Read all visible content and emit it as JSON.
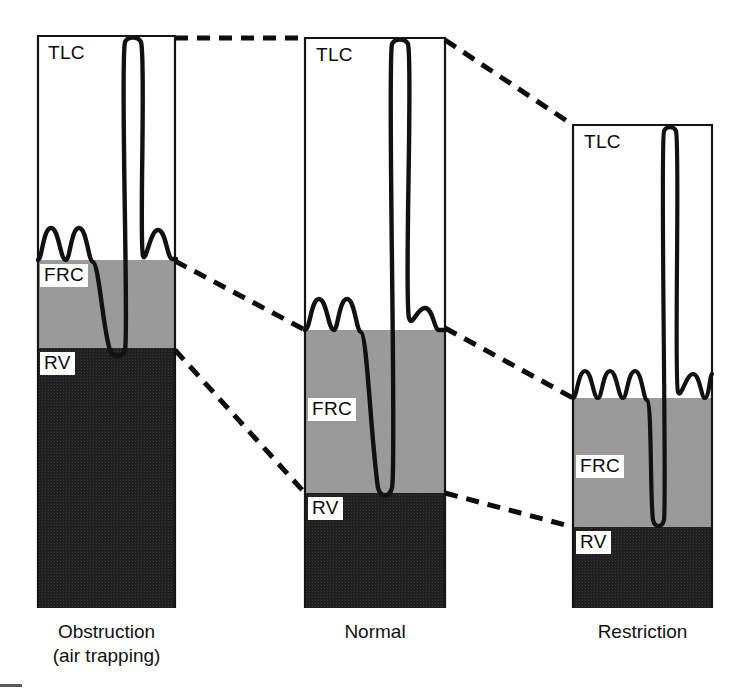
{
  "figure": {
    "type": "lung-volume-spirogram-comparison",
    "background_color": "#ffffff",
    "width": 737,
    "height": 690
  },
  "colors": {
    "tlc_fill": "#ffffff",
    "frc_fill": "#9a9a9a",
    "rv_fill": "#1e1e1e",
    "outline": "#141414",
    "trace": "#111111",
    "dashed_connector": "#0d0d0d",
    "label_text": "#0b0b0b",
    "label_background": "#ffffff"
  },
  "volume_labels": {
    "tlc": "TLC",
    "frc": "FRC",
    "rv": "RV"
  },
  "panels": [
    {
      "id": "obstruction",
      "caption": "Obstruction\n(air trapping)",
      "caption_line1": "Obstruction",
      "caption_line2": "(air trapping)",
      "box": {
        "x": 38,
        "y": 36,
        "width": 137,
        "height": 572
      },
      "levels": {
        "tlc_y": 36,
        "frc_y": 260,
        "rv_y": 348,
        "bottom_y": 608
      },
      "label_positions": {
        "tlc": {
          "x": 46,
          "y": 42
        },
        "frc": {
          "x": 40,
          "y": 264
        },
        "rv": {
          "x": 40,
          "y": 352
        }
      },
      "trace": {
        "tidal_breaths": 2,
        "tidal_baseline_y": 260,
        "tidal_peak_y": 228,
        "inspiratory_peak_y": 38,
        "expiratory_trough_y": 350,
        "post_tidal_breaths": 1
      }
    },
    {
      "id": "normal",
      "caption": "Normal",
      "caption_line1": "Normal",
      "caption_line2": "",
      "box": {
        "x": 305,
        "y": 38,
        "width": 140,
        "height": 570
      },
      "levels": {
        "tlc_y": 38,
        "frc_y": 330,
        "rv_y": 493,
        "bottom_y": 608
      },
      "label_positions": {
        "tlc": {
          "x": 314,
          "y": 44
        },
        "frc": {
          "x": 308,
          "y": 398
        },
        "rv": {
          "x": 308,
          "y": 497
        }
      },
      "trace": {
        "tidal_breaths": 2,
        "tidal_baseline_y": 330,
        "tidal_peak_y": 299,
        "inspiratory_peak_y": 40,
        "expiratory_trough_y": 495,
        "post_tidal_breaths": 1
      }
    },
    {
      "id": "restriction",
      "caption": "Restriction",
      "caption_line1": "Restriction",
      "caption_line2": "",
      "box": {
        "x": 573,
        "y": 125,
        "width": 139,
        "height": 483
      },
      "levels": {
        "tlc_y": 125,
        "frc_y": 398,
        "rv_y": 527,
        "bottom_y": 608
      },
      "label_positions": {
        "tlc": {
          "x": 582,
          "y": 131
        },
        "frc": {
          "x": 576,
          "y": 455
        },
        "rv": {
          "x": 576,
          "y": 531
        }
      },
      "trace": {
        "tidal_breaths": 3,
        "tidal_baseline_y": 398,
        "tidal_peak_y": 371,
        "inspiratory_peak_y": 127,
        "expiratory_trough_y": 529,
        "post_tidal_breaths": 3
      }
    }
  ],
  "connectors": [
    {
      "id": "tlc-left-to-middle",
      "level": "TLC",
      "from": {
        "x": 175,
        "y": 38
      },
      "to": {
        "x": 305,
        "y": 38
      }
    },
    {
      "id": "tlc-middle-to-right",
      "level": "TLC",
      "from": {
        "x": 445,
        "y": 40
      },
      "to": {
        "x": 573,
        "y": 125
      }
    },
    {
      "id": "frc-left-to-middle",
      "level": "FRC",
      "from": {
        "x": 175,
        "y": 261
      },
      "to": {
        "x": 305,
        "y": 330
      }
    },
    {
      "id": "frc-middle-to-right",
      "level": "FRC",
      "from": {
        "x": 445,
        "y": 328
      },
      "to": {
        "x": 573,
        "y": 398
      }
    },
    {
      "id": "rv-left-to-middle",
      "level": "RV",
      "from": {
        "x": 175,
        "y": 350
      },
      "to": {
        "x": 305,
        "y": 493
      }
    },
    {
      "id": "rv-middle-to-right",
      "level": "RV",
      "from": {
        "x": 445,
        "y": 493
      },
      "to": {
        "x": 573,
        "y": 527
      }
    }
  ],
  "captions": {
    "obstruction": {
      "x": 38,
      "y": 620,
      "width": 137
    },
    "normal": {
      "x": 305,
      "y": 620,
      "width": 140
    },
    "restriction": {
      "x": 573,
      "y": 620,
      "width": 139
    }
  }
}
